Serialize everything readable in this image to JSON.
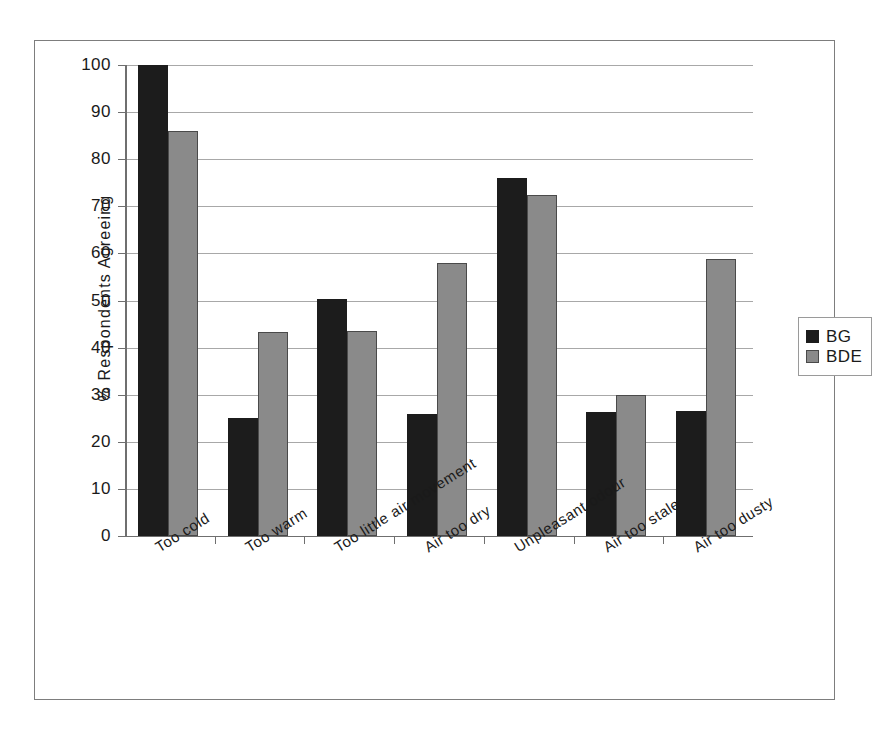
{
  "chart_data": {
    "type": "bar",
    "title": "",
    "xlabel": "",
    "ylabel": "% Respondents Agreeing",
    "ylim": [
      0,
      100
    ],
    "yticks": [
      0,
      10,
      20,
      30,
      40,
      50,
      60,
      70,
      80,
      90,
      100
    ],
    "grid": true,
    "legend_position": "right",
    "categories": [
      "Too cold",
      "Too warm",
      "Too little air movement",
      "Air too dry",
      "Unpleasant odour",
      "Air too stale",
      "Air too dusty"
    ],
    "series": [
      {
        "name": "BG",
        "color": "#1c1c1c",
        "values": [
          100,
          25,
          50.3,
          26,
          76,
          26.3,
          26.6
        ]
      },
      {
        "name": "BDE",
        "color": "#8a8a8a",
        "values": [
          86,
          43.3,
          43.5,
          58,
          72.5,
          30,
          58.8
        ]
      }
    ]
  },
  "legend": {
    "entries": [
      {
        "label": "BG",
        "color": "#1c1c1c"
      },
      {
        "label": "BDE",
        "color": "#8a8a8a"
      }
    ]
  },
  "axis": {
    "y_title": "% Respondents Agreeing",
    "tick_labels": [
      "100",
      "90",
      "80",
      "70",
      "60",
      "50",
      "40",
      "30",
      "20",
      "10",
      "0"
    ]
  }
}
